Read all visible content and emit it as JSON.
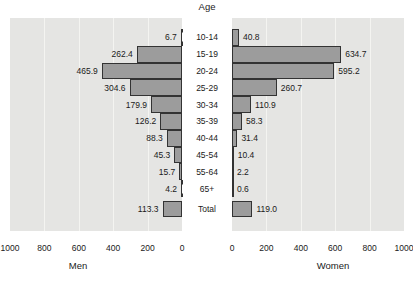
{
  "chart_data": {
    "type": "bar",
    "subtype": "population-pyramid",
    "center_axis_label": "Age",
    "categories": [
      "10-14",
      "15-19",
      "20-24",
      "25-29",
      "30-34",
      "35-39",
      "40-44",
      "45-54",
      "55-64",
      "65+",
      "Total"
    ],
    "series": [
      {
        "name": "Men",
        "side": "left",
        "values": [
          6.7,
          262.4,
          465.9,
          304.6,
          179.9,
          126.2,
          88.3,
          45.3,
          15.7,
          4.2,
          113.3
        ]
      },
      {
        "name": "Women",
        "side": "right",
        "values": [
          40.8,
          634.7,
          595.2,
          260.7,
          110.9,
          58.3,
          31.4,
          10.4,
          2.2,
          0.6,
          119.0
        ]
      }
    ],
    "x_axis": {
      "xlim_per_side": [
        0,
        1000
      ],
      "tick_interval": 200,
      "ticks_left": [
        1000,
        800,
        600,
        400,
        200,
        0
      ],
      "ticks_right": [
        0,
        200,
        400,
        600,
        800,
        1000
      ]
    },
    "xlabel_left": "Men",
    "xlabel_right": "Women",
    "value_labels_shown": true,
    "value_label_decimals": 1,
    "grid": true,
    "legend": "none",
    "colors": {
      "bar_fill": "#9c9c9c",
      "bar_edge": "#333333",
      "plot_background": "#e5e5e3",
      "gridline": "#f4f4f1",
      "text": "#1a1a1a",
      "page_background": "#ffffff"
    }
  }
}
